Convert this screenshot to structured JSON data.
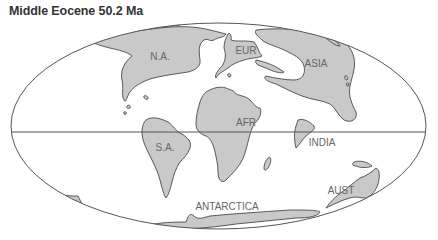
{
  "map": {
    "title": "Middle Eocene 50.2 Ma",
    "projection": "ellipse (Mollweide-style)",
    "colors": {
      "land_fill": "#c9c9c9",
      "land_outline": "#4a4a4a",
      "graticule": "#555555",
      "label": "#666666",
      "background": "#ffffff"
    },
    "labels": {
      "north_america": "N.A.",
      "europe": "EUR",
      "asia": "ASIA",
      "africa": "AFR",
      "south_america": "S.A.",
      "india": "INDIA",
      "australia": "AUST",
      "antarctica": "ANTARCTICA"
    }
  }
}
